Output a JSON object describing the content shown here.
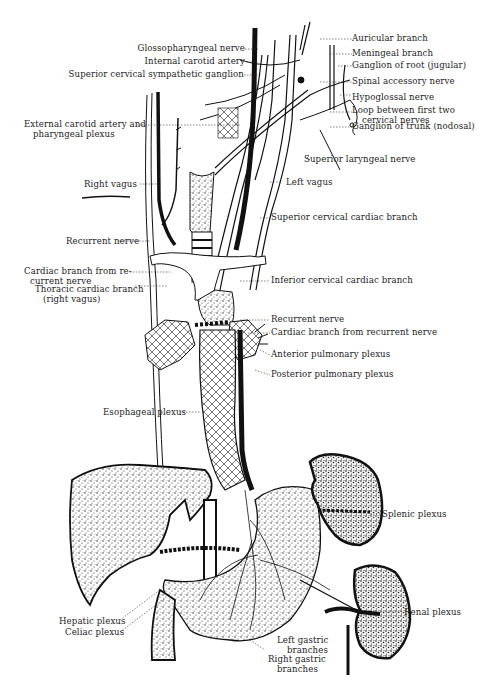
{
  "figure": {
    "background": "#ffffff",
    "ink": "#1a1a1a"
  },
  "labels": {
    "glossopharyngeal_nerve": "Glossopharyngeal nerve",
    "internal_carotid_artery": "Internal carotid artery",
    "superior_cervical_sympathetic_ganglion": "Superior cervical sympathetic ganglion",
    "auricular_branch": "Auricular branch",
    "meningeal_branch": "Meningeal branch",
    "ganglion_of_root": "Ganglion of root (jugular)",
    "spinal_accessory_nerve": "Spinal accessory nerve",
    "hypoglossal_nerve": "Hypoglossal nerve",
    "loop_line1": "Loop between first two",
    "loop_line2": "cervical nerves",
    "ganglion_of_trunk": "Ganglion of trunk (nodosal)",
    "external_carotid_line1": "External carotid artery and",
    "external_carotid_line2": "pharyngeal plexus",
    "superior_laryngeal_nerve": "Superior laryngeal nerve",
    "right_vagus": "Right vagus",
    "left_vagus": "Left vagus",
    "superior_cervical_cardiac_branch": "Superior cervical cardiac branch",
    "recurrent_nerve_right": "Recurrent nerve",
    "cardiac_branch_re_line1": "Cardiac branch from re-",
    "cardiac_branch_re_line2": "current nerve",
    "thoracic_cardiac_line1": "Thoracic cardiac branch",
    "thoracic_cardiac_line2": "(right vagus)",
    "inferior_cervical_cardiac_branch": "Inferior cervical cardiac branch",
    "recurrent_nerve_left": "Recurrent nerve",
    "cardiac_branch_recurrent_left": "Cardiac branch from recurrent nerve",
    "anterior_pulmonary_plexus": "Anterior pulmonary plexus",
    "posterior_pulmonary_plexus": "Posterior pulmonary plexus",
    "esophageal_plexus": "Esophageal plexus",
    "splenic_plexus": "Splenic plexus",
    "renal_plexus": "Renal plexus",
    "hepatic_plexus": "Hepatic plexus",
    "celiac_plexus": "Celiac plexus",
    "left_gastric_line1": "Left gastric",
    "left_gastric_line2": "branches",
    "right_gastric_line1": "Right gastric",
    "right_gastric_line2": "branches"
  }
}
